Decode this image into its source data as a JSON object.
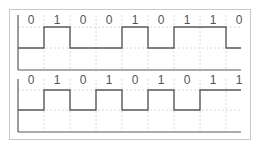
{
  "diagram": {
    "title": "",
    "colors": {
      "signal": "#5a5a5a",
      "grid": "#d8d8d8",
      "border": "#c8c8c8",
      "text": "#555555"
    },
    "signals": [
      {
        "name": "signal-top",
        "bits": [
          "0",
          "1",
          "0",
          "0",
          "1",
          "0",
          "1",
          "1",
          "0"
        ],
        "y_high": 27,
        "y_low": 48,
        "y_base": 70,
        "y_top": 15,
        "label_y": 24
      },
      {
        "name": "signal-bottom",
        "bits": [
          "0",
          "1",
          "0",
          "1",
          "0",
          "1",
          "0",
          "1",
          "1"
        ],
        "y_high": 90,
        "y_low": 110,
        "y_base": 132,
        "y_top": 79,
        "label_y": 84
      }
    ],
    "x_start": 18,
    "bit_width": 26,
    "x_end": 241
  }
}
